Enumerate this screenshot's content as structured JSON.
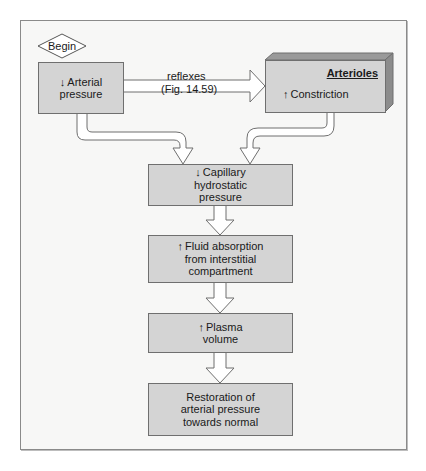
{
  "diagram": {
    "type": "flowchart",
    "colors": {
      "background": "#ffffff",
      "frame_fill": "#f7f7f6",
      "box_fill": "#d4d4d4",
      "box_border": "#6f6f6f",
      "arrow_fill": "#ffffff",
      "arrow_stroke": "#6f6f6f"
    },
    "start": {
      "label": "Begin"
    },
    "nodes": [
      {
        "id": "arterial-pressure",
        "icon": "down-arrow-icon",
        "arrow": "↓",
        "lines": [
          "Arterial",
          "pressure"
        ]
      },
      {
        "id": "arterioles",
        "title": "Arterioles",
        "icon": "up-arrow-icon",
        "arrow": "↑",
        "lines": [
          "Constriction"
        ]
      },
      {
        "id": "capillary",
        "icon": "down-arrow-icon",
        "arrow": "↓",
        "lines": [
          "Capillary",
          "hydrostatic",
          "pressure"
        ]
      },
      {
        "id": "fluid",
        "icon": "up-arrow-icon",
        "arrow": "↑",
        "lines": [
          "Fluid absorption",
          "from interstitial",
          "compartment"
        ]
      },
      {
        "id": "plasma",
        "icon": "up-arrow-icon",
        "arrow": "↑",
        "lines": [
          "Plasma",
          "volume"
        ]
      },
      {
        "id": "restoration",
        "lines": [
          "Restoration of",
          "arterial pressure",
          "towards normal"
        ]
      }
    ],
    "edges": [
      {
        "from": "arterial-pressure",
        "to": "arterioles",
        "label_lines": [
          "reflexes",
          "(Fig. 14.59)"
        ]
      },
      {
        "from": "arterial-pressure",
        "to": "capillary"
      },
      {
        "from": "arterioles",
        "to": "capillary"
      },
      {
        "from": "capillary",
        "to": "fluid"
      },
      {
        "from": "fluid",
        "to": "plasma"
      },
      {
        "from": "plasma",
        "to": "restoration"
      }
    ]
  }
}
